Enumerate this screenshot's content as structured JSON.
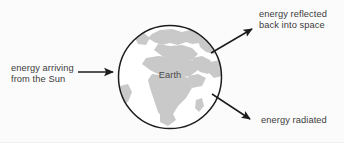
{
  "diagram": {
    "background_color": "#fbfbfb",
    "text_color": "#3b3b3b",
    "stroke_color": "#1c1c1c",
    "land_color": "#c9c9c9",
    "ocean_color": "#ffffff",
    "earth": {
      "label": "Earth",
      "center_x": 170,
      "center_y": 77,
      "radius": 52
    },
    "arrows": [
      {
        "name": "incoming-energy",
        "label": "energy arriving\nfrom the Sun",
        "direction": "right",
        "from": [
          78,
          72
        ],
        "to": [
          117,
          72
        ]
      },
      {
        "name": "reflected-energy",
        "label": "energy reflected\nback into space",
        "direction": "up-right",
        "from": [
          211,
          53
        ],
        "to": [
          256,
          26
        ]
      },
      {
        "name": "radiated-energy",
        "label": "energy radiated",
        "direction": "down-right",
        "from": [
          212,
          94
        ],
        "to": [
          254,
          122
        ]
      }
    ]
  }
}
